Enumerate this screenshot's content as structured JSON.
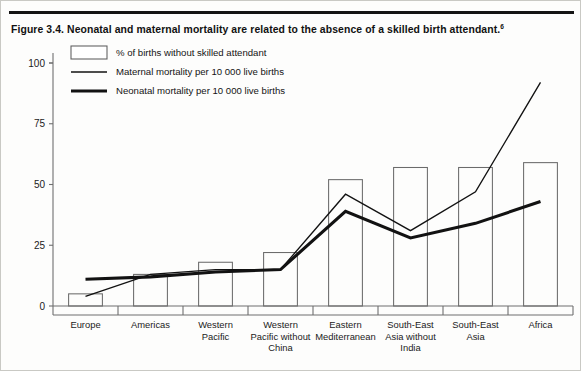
{
  "figure": {
    "caption": "Figure 3.4. Neonatal and maternal mortality are related to the absence of a skilled birth attendant.",
    "caption_superscript": "6"
  },
  "legend": {
    "position": "top-left",
    "items": [
      {
        "key": "bars",
        "marker": "box",
        "label": "% of births without skilled attendant"
      },
      {
        "key": "maternal",
        "marker": "thin-line",
        "label": "Maternal mortality per 10 000 live births"
      },
      {
        "key": "neonatal",
        "marker": "thick-line",
        "label": "Neonatal mortality per 10 000 live births"
      }
    ]
  },
  "axis": {
    "y_ticks": [
      "0",
      "25",
      "50",
      "75",
      "100"
    ],
    "y_values": [
      0,
      25,
      50,
      75,
      100
    ],
    "ylim": [
      0,
      100
    ],
    "xlabel": "",
    "ylabel": ""
  },
  "chart_data": {
    "type": "bar",
    "title": "Figure 3.4. Neonatal and maternal mortality are related to the absence of a skilled birth attendant.",
    "xlabel": "",
    "ylabel": "",
    "ylim": [
      0,
      100
    ],
    "grid": false,
    "legend_position": "top-left",
    "categories": [
      "Europe",
      "Americas",
      "Western Pacific",
      "Western Pacific without China",
      "Eastern Mediterranean",
      "South-East Asia without India",
      "South-East Asia",
      "Africa"
    ],
    "category_lines": [
      [
        "Europe"
      ],
      [
        "Americas"
      ],
      [
        "Western",
        "Pacific"
      ],
      [
        "Western",
        "Pacific without",
        "China"
      ],
      [
        "Eastern",
        "Mediterranean"
      ],
      [
        "South-East",
        "Asia without",
        "India"
      ],
      [
        "South-East",
        "Asia"
      ],
      [
        "Africa"
      ]
    ],
    "series": [
      {
        "name": "% of births without skilled attendant",
        "type": "bar",
        "values": [
          5,
          13,
          18,
          22,
          52,
          57,
          57,
          59
        ]
      },
      {
        "name": "Maternal mortality per 10 000 live births",
        "type": "line",
        "style": "thin",
        "values": [
          4,
          13,
          15,
          15,
          46,
          31,
          47,
          92
        ]
      },
      {
        "name": "Neonatal mortality per 10 000 live births",
        "type": "line",
        "style": "thick",
        "values": [
          11,
          12,
          14,
          15,
          39,
          28,
          34,
          43
        ]
      }
    ]
  }
}
